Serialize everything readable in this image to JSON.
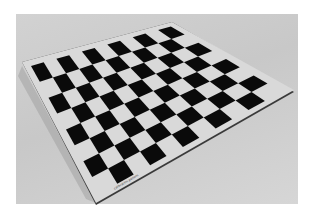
{
  "image": {
    "subject": "checkerboard calibration pattern on a flat board",
    "board": {
      "rows": 8,
      "cols": 11,
      "corners": {
        "top_left": [
          22,
          62
        ],
        "top_right": [
          172,
          22
        ],
        "bottom_right": [
          294,
          90
        ],
        "bottom_left": [
          96,
          203
        ]
      },
      "board_color": "#d9d9d9",
      "dark_square_color": "#0a0a0a",
      "edge_color": "#3a3a3a",
      "label_text": "calibration pattern"
    },
    "background_color": "#cccccc"
  }
}
